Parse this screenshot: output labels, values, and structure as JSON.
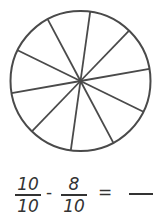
{
  "diagram": {
    "type": "fraction-circle",
    "slices": 10,
    "stroke_color": "#4a4a4a",
    "fill_color": "#ffffff"
  },
  "equation": {
    "term1": {
      "numerator": "10",
      "denominator": "10"
    },
    "operator": "-",
    "term2": {
      "numerator": "8",
      "denominator": "10"
    },
    "equals": "=",
    "answer": ""
  }
}
